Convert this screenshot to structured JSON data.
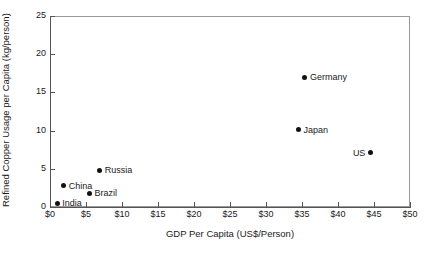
{
  "chart_data": {
    "type": "scatter",
    "title": "",
    "xlabel": "GDP Per Capita (US$/Person)",
    "ylabel": "Refined Copper Usage per Capita (kg/person)",
    "xlim": [
      0,
      50
    ],
    "ylim": [
      0,
      25
    ],
    "grid": false,
    "legend_position": "none",
    "x_tick_labels": [
      "$0",
      "$5",
      "$10",
      "$15",
      "$20",
      "$25",
      "$30",
      "$35",
      "$40",
      "$45",
      "$50"
    ],
    "x_tick_values": [
      0,
      5,
      10,
      15,
      20,
      25,
      30,
      35,
      40,
      45,
      50
    ],
    "y_tick_labels": [
      "0",
      "5",
      "10",
      "15",
      "20",
      "25"
    ],
    "y_tick_values": [
      0,
      5,
      10,
      15,
      20,
      25
    ],
    "points": [
      {
        "name": "India",
        "x": 1.0,
        "y": 0.5,
        "label": "India",
        "label_side": "right"
      },
      {
        "name": "China",
        "x": 1.9,
        "y": 2.8,
        "label": "China",
        "label_side": "right"
      },
      {
        "name": "Brazil",
        "x": 5.5,
        "y": 1.8,
        "label": "Brazil",
        "label_side": "right"
      },
      {
        "name": "Russia",
        "x": 6.9,
        "y": 4.8,
        "label": "Russia",
        "label_side": "right"
      },
      {
        "name": "Japan",
        "x": 34.5,
        "y": 10.1,
        "label": "Japan",
        "label_side": "right"
      },
      {
        "name": "Germany",
        "x": 35.4,
        "y": 17.0,
        "label": "Germany",
        "label_side": "right"
      },
      {
        "name": "US",
        "x": 44.5,
        "y": 7.1,
        "label": "US",
        "label_side": "left"
      }
    ],
    "marker_color": "#111111",
    "axis_color": "#555555",
    "frame_color": "#9a9a9a",
    "background_color": "#ffffff"
  }
}
